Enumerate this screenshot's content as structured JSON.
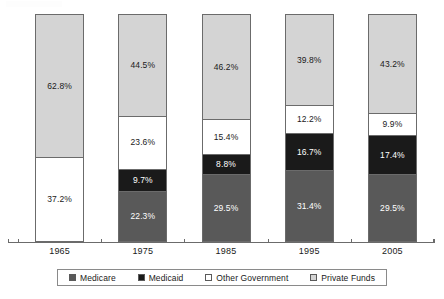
{
  "chart_data": {
    "type": "bar",
    "subtype": "stacked-bar-100",
    "title": "",
    "xlabel": "",
    "ylabel": "",
    "ylim": [
      0,
      100
    ],
    "grid": false,
    "legend_position": "bottom",
    "categories": [
      "1965",
      "1975",
      "1985",
      "1995",
      "2005"
    ],
    "stack_order_bottom_to_top": [
      "Medicare",
      "Medicaid",
      "Other Government",
      "Private Funds"
    ],
    "series": [
      {
        "name": "Medicare",
        "color": "#595959",
        "label_color": "#ffffff",
        "values": [
          0,
          22.3,
          29.5,
          31.4,
          29.5
        ],
        "labels": [
          "",
          "22.3%",
          "29.5%",
          "31.4%",
          "29.5%"
        ]
      },
      {
        "name": "Medicaid",
        "color": "#1a1a1a",
        "label_color": "#ffffff",
        "values": [
          0,
          9.7,
          8.8,
          16.7,
          17.4
        ],
        "labels": [
          "",
          "9.7%",
          "8.8%",
          "16.7%",
          "17.4%"
        ]
      },
      {
        "name": "Other Government",
        "color": "#ffffff",
        "label_color": "#1a1a1a",
        "values": [
          37.2,
          23.6,
          15.4,
          12.2,
          9.9
        ],
        "labels": [
          "37.2%",
          "23.6%",
          "15.4%",
          "12.2%",
          "9.9%"
        ]
      },
      {
        "name": "Private Funds",
        "color": "#d4d4d4",
        "label_color": "#1a1a1a",
        "values": [
          62.8,
          44.5,
          46.2,
          39.8,
          43.2
        ],
        "labels": [
          "62.8%",
          "44.5%",
          "46.2%",
          "39.8%",
          "43.2%"
        ]
      }
    ]
  },
  "legend": {
    "items": [
      {
        "label": "Medicare",
        "color": "#595959",
        "swatch_name": "legend-swatch-medicare"
      },
      {
        "label": "Medicaid",
        "color": "#1a1a1a",
        "swatch_name": "legend-swatch-medicaid"
      },
      {
        "label": "Other Government",
        "color": "#ffffff",
        "swatch_name": "legend-swatch-other-government"
      },
      {
        "label": "Private Funds",
        "color": "#d4d4d4",
        "swatch_name": "legend-swatch-private-funds"
      }
    ]
  },
  "axis": {
    "categories": [
      "1965",
      "1975",
      "1985",
      "1995",
      "2005"
    ]
  },
  "colors": {
    "medicare": "#595959",
    "medicaid": "#1a1a1a",
    "other_government": "#ffffff",
    "private_funds": "#d4d4d4",
    "outline": "#6b6b6b",
    "text": "#1a1a1a",
    "background": "#ffffff"
  }
}
